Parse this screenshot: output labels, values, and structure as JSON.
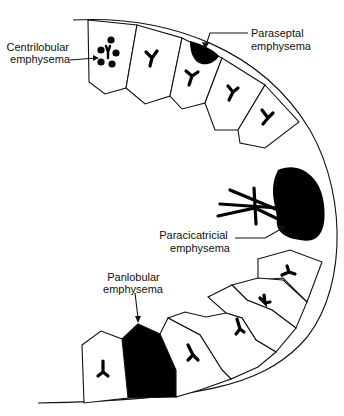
{
  "diagram": {
    "labels": {
      "centrilobular": [
        "Centrilobular",
        "emphysema"
      ],
      "paraseptal": [
        "Paraseptal",
        "emphysema"
      ],
      "paracicatricial": [
        "Paracicatricial",
        "emphysema"
      ],
      "panlobular": [
        "Panlobular",
        "emphysema"
      ]
    },
    "colors": {
      "line": "#111111",
      "lesion": "#000000",
      "background": "#ffffff"
    },
    "lobules": [
      {
        "id": "centrilobular",
        "state": "centrilobular-clusters"
      },
      {
        "id": "normal-1",
        "state": "normal"
      },
      {
        "id": "paraseptal",
        "state": "subpleural-lesion"
      },
      {
        "id": "normal-2",
        "state": "normal"
      },
      {
        "id": "normal-3",
        "state": "normal"
      },
      {
        "id": "normal-4",
        "state": "normal"
      },
      {
        "id": "normal-5",
        "state": "normal"
      },
      {
        "id": "normal-6",
        "state": "normal"
      },
      {
        "id": "normal-7",
        "state": "normal"
      },
      {
        "id": "panlobular",
        "state": "entirely-destroyed"
      },
      {
        "id": "normal-8",
        "state": "normal"
      }
    ]
  }
}
